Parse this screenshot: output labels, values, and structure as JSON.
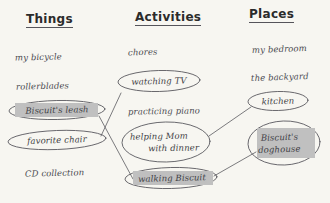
{
  "worksheet": {
    "title": "Things Activities Places brainstorm worksheet",
    "background_color": "#f7f6f1",
    "ink_color": "#4a4a50",
    "highlight_color": "#c0c0c0"
  },
  "columns": [
    {
      "header": "Things"
    },
    {
      "header": "Activities"
    },
    {
      "header": "Places"
    }
  ],
  "things": {
    "header": "Things",
    "items": [
      {
        "label": "my bicycle",
        "circled": false,
        "highlighted": false
      },
      {
        "label": "rollerblades",
        "circled": false,
        "highlighted": false
      },
      {
        "label": "Biscuit's leash",
        "circled": true,
        "highlighted": true
      },
      {
        "label": "favorite chair",
        "circled": true,
        "highlighted": false
      },
      {
        "label": "CD collection",
        "circled": false,
        "highlighted": false
      }
    ]
  },
  "activities": {
    "header": "Activities",
    "items": [
      {
        "label": "chores",
        "circled": false,
        "highlighted": false
      },
      {
        "label": "watching TV",
        "circled": true,
        "highlighted": false
      },
      {
        "label": "practicing piano",
        "circled": false,
        "highlighted": false
      },
      {
        "label_line1": "helping Mom",
        "label_line2": "with dinner",
        "circled": true,
        "highlighted": false
      },
      {
        "label": "walking Biscuit",
        "circled": true,
        "highlighted": true
      }
    ]
  },
  "places": {
    "header": "Places",
    "items": [
      {
        "label": "my bedroom",
        "circled": false,
        "highlighted": false
      },
      {
        "label": "the backyard",
        "circled": false,
        "highlighted": false
      },
      {
        "label": "kitchen",
        "circled": true,
        "highlighted": false
      },
      {
        "label_line1": "Biscuit's",
        "label_line2": "doghouse",
        "circled": true,
        "highlighted": true
      }
    ]
  },
  "connections": [
    {
      "from": "favorite chair",
      "to": "watching TV"
    },
    {
      "from": "Biscuit's leash",
      "to": "walking Biscuit"
    },
    {
      "from": "helping Mom with dinner",
      "to": "kitchen"
    },
    {
      "from": "walking Biscuit",
      "to": "Biscuit's doghouse"
    }
  ]
}
